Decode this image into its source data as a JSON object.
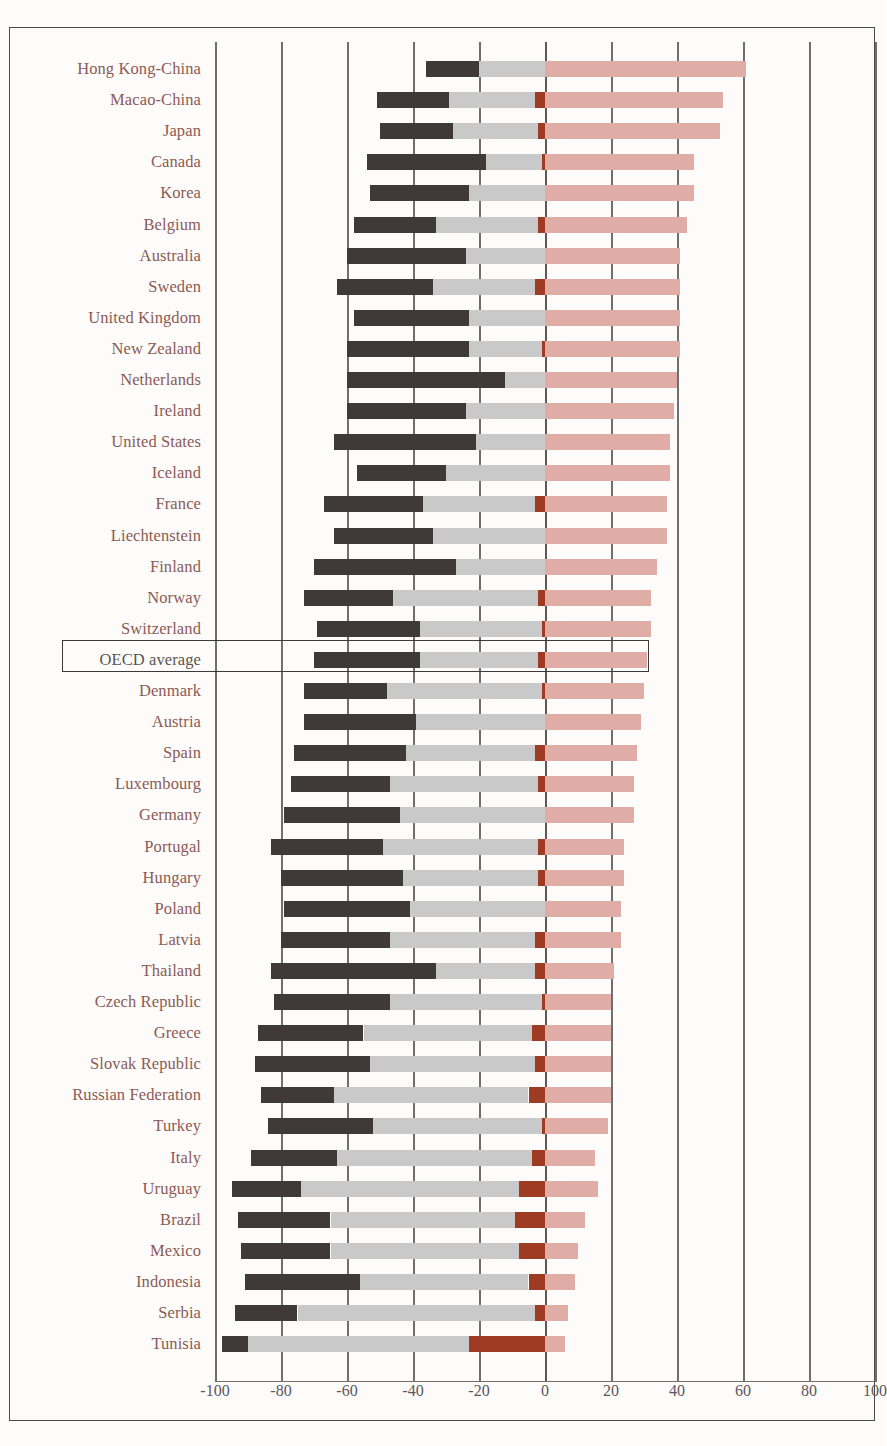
{
  "chart_data": {
    "type": "bar",
    "subtype": "diverging-stacked-horizontal",
    "title": "",
    "xlabel": "",
    "ylabel": "",
    "xlim": [
      -100,
      100
    ],
    "xticks": [
      -100,
      -80,
      -60,
      -40,
      -20,
      0,
      20,
      40,
      60,
      80,
      100
    ],
    "xtick_labels": [
      "-100",
      "-80",
      "-60",
      "-40",
      "-20",
      "0",
      "20",
      "40",
      "60",
      "80",
      "100"
    ],
    "grid": true,
    "legend": "none",
    "series": [
      {
        "name": "negative-outer",
        "color": "#3f3a38"
      },
      {
        "name": "negative-inner",
        "color": "#c9c9c9"
      },
      {
        "name": "positive-inner",
        "color": "#9e3b22"
      },
      {
        "name": "positive-outer",
        "color": "#dfada6"
      }
    ],
    "highlight_category": "OECD average",
    "categories": [
      "Hong Kong-China",
      "Macao-China",
      "Japan",
      "Canada",
      "Korea",
      "Belgium",
      "Australia",
      "Sweden",
      "United Kingdom",
      "New Zealand",
      "Netherlands",
      "Ireland",
      "United States",
      "Iceland",
      "France",
      "Liechtenstein",
      "Finland",
      "Norway",
      "Switzerland",
      "OECD average",
      "Denmark",
      "Austria",
      "Spain",
      "Luxembourg",
      "Germany",
      "Portugal",
      "Hungary",
      "Poland",
      "Latvia",
      "Thailand",
      "Czech Republic",
      "Greece",
      "Slovak Republic",
      "Russian Federation",
      "Turkey",
      "Italy",
      "Uruguay",
      "Brazil",
      "Mexico",
      "Indonesia",
      "Serbia",
      "Tunisia"
    ],
    "rows": [
      {
        "category": "Hong Kong-China",
        "neg_outer_start": -36,
        "neg_outer_end": -20,
        "neg_inner_end": 0,
        "pos_inner_end": 0,
        "pos_outer_end": 61
      },
      {
        "category": "Macao-China",
        "neg_outer_start": -51,
        "neg_outer_end": -29,
        "neg_inner_end": -3,
        "pos_inner_end": 0,
        "pos_outer_end": 54
      },
      {
        "category": "Japan",
        "neg_outer_start": -50,
        "neg_outer_end": -28,
        "neg_inner_end": -2,
        "pos_inner_end": 0,
        "pos_outer_end": 53
      },
      {
        "category": "Canada",
        "neg_outer_start": -54,
        "neg_outer_end": -18,
        "neg_inner_end": -1,
        "pos_inner_end": 0,
        "pos_outer_end": 45
      },
      {
        "category": "Korea",
        "neg_outer_start": -53,
        "neg_outer_end": -23,
        "neg_inner_end": 0,
        "pos_inner_end": 0,
        "pos_outer_end": 45
      },
      {
        "category": "Belgium",
        "neg_outer_start": -58,
        "neg_outer_end": -33,
        "neg_inner_end": -2,
        "pos_inner_end": 0,
        "pos_outer_end": 43
      },
      {
        "category": "Australia",
        "neg_outer_start": -60,
        "neg_outer_end": -24,
        "neg_inner_end": 0,
        "pos_inner_end": 0,
        "pos_outer_end": 41
      },
      {
        "category": "Sweden",
        "neg_outer_start": -63,
        "neg_outer_end": -34,
        "neg_inner_end": -3,
        "pos_inner_end": 0,
        "pos_outer_end": 41
      },
      {
        "category": "United Kingdom",
        "neg_outer_start": -58,
        "neg_outer_end": -23,
        "neg_inner_end": 0,
        "pos_inner_end": 0,
        "pos_outer_end": 41
      },
      {
        "category": "New Zealand",
        "neg_outer_start": -60,
        "neg_outer_end": -23,
        "neg_inner_end": -1,
        "pos_inner_end": 0,
        "pos_outer_end": 41
      },
      {
        "category": "Netherlands",
        "neg_outer_start": -60,
        "neg_outer_end": -12,
        "neg_inner_end": 0,
        "pos_inner_end": 0,
        "pos_outer_end": 40
      },
      {
        "category": "Ireland",
        "neg_outer_start": -60,
        "neg_outer_end": -24,
        "neg_inner_end": 0,
        "pos_inner_end": 0,
        "pos_outer_end": 39
      },
      {
        "category": "United States",
        "neg_outer_start": -64,
        "neg_outer_end": -21,
        "neg_inner_end": 0,
        "pos_inner_end": 0,
        "pos_outer_end": 38
      },
      {
        "category": "Iceland",
        "neg_outer_start": -57,
        "neg_outer_end": -30,
        "neg_inner_end": 0,
        "pos_inner_end": 0,
        "pos_outer_end": 38
      },
      {
        "category": "France",
        "neg_outer_start": -67,
        "neg_outer_end": -37,
        "neg_inner_end": -3,
        "pos_inner_end": 0,
        "pos_outer_end": 37
      },
      {
        "category": "Liechtenstein",
        "neg_outer_start": -64,
        "neg_outer_end": -34,
        "neg_inner_end": 0,
        "pos_inner_end": 0,
        "pos_outer_end": 37
      },
      {
        "category": "Finland",
        "neg_outer_start": -70,
        "neg_outer_end": -27,
        "neg_inner_end": 0,
        "pos_inner_end": 0,
        "pos_outer_end": 34
      },
      {
        "category": "Norway",
        "neg_outer_start": -73,
        "neg_outer_end": -46,
        "neg_inner_end": -2,
        "pos_inner_end": 0,
        "pos_outer_end": 32
      },
      {
        "category": "Switzerland",
        "neg_outer_start": -69,
        "neg_outer_end": -38,
        "neg_inner_end": -1,
        "pos_inner_end": 0,
        "pos_outer_end": 32
      },
      {
        "category": "OECD average",
        "neg_outer_start": -70,
        "neg_outer_end": -38,
        "neg_inner_end": -2,
        "pos_inner_end": 0,
        "pos_outer_end": 31
      },
      {
        "category": "Denmark",
        "neg_outer_start": -73,
        "neg_outer_end": -48,
        "neg_inner_end": -1,
        "pos_inner_end": 0,
        "pos_outer_end": 30
      },
      {
        "category": "Austria",
        "neg_outer_start": -73,
        "neg_outer_end": -39,
        "neg_inner_end": 0,
        "pos_inner_end": 0,
        "pos_outer_end": 29
      },
      {
        "category": "Spain",
        "neg_outer_start": -76,
        "neg_outer_end": -42,
        "neg_inner_end": -3,
        "pos_inner_end": 0,
        "pos_outer_end": 28
      },
      {
        "category": "Luxembourg",
        "neg_outer_start": -77,
        "neg_outer_end": -47,
        "neg_inner_end": -2,
        "pos_inner_end": 0,
        "pos_outer_end": 27
      },
      {
        "category": "Germany",
        "neg_outer_start": -79,
        "neg_outer_end": -44,
        "neg_inner_end": 0,
        "pos_inner_end": 0,
        "pos_outer_end": 27
      },
      {
        "category": "Portugal",
        "neg_outer_start": -83,
        "neg_outer_end": -49,
        "neg_inner_end": -2,
        "pos_inner_end": 0,
        "pos_outer_end": 24
      },
      {
        "category": "Hungary",
        "neg_outer_start": -80,
        "neg_outer_end": -43,
        "neg_inner_end": -2,
        "pos_inner_end": 0,
        "pos_outer_end": 24
      },
      {
        "category": "Poland",
        "neg_outer_start": -79,
        "neg_outer_end": -41,
        "neg_inner_end": 0,
        "pos_inner_end": 0,
        "pos_outer_end": 23
      },
      {
        "category": "Latvia",
        "neg_outer_start": -80,
        "neg_outer_end": -47,
        "neg_inner_end": -3,
        "pos_inner_end": 0,
        "pos_outer_end": 23
      },
      {
        "category": "Thailand",
        "neg_outer_start": -83,
        "neg_outer_end": -33,
        "neg_inner_end": -3,
        "pos_inner_end": 0,
        "pos_outer_end": 21
      },
      {
        "category": "Czech Republic",
        "neg_outer_start": -82,
        "neg_outer_end": -47,
        "neg_inner_end": -1,
        "pos_inner_end": 0,
        "pos_outer_end": 20
      },
      {
        "category": "Greece",
        "neg_outer_start": -87,
        "neg_outer_end": -55,
        "neg_inner_end": -4,
        "pos_inner_end": 0,
        "pos_outer_end": 20
      },
      {
        "category": "Slovak Republic",
        "neg_outer_start": -88,
        "neg_outer_end": -53,
        "neg_inner_end": -3,
        "pos_inner_end": 0,
        "pos_outer_end": 20
      },
      {
        "category": "Russian Federation",
        "neg_outer_start": -86,
        "neg_outer_end": -64,
        "neg_inner_end": -5,
        "pos_inner_end": 0,
        "pos_outer_end": 20
      },
      {
        "category": "Turkey",
        "neg_outer_start": -84,
        "neg_outer_end": -52,
        "neg_inner_end": -1,
        "pos_inner_end": 0,
        "pos_outer_end": 19
      },
      {
        "category": "Italy",
        "neg_outer_start": -89,
        "neg_outer_end": -63,
        "neg_inner_end": -4,
        "pos_inner_end": 0,
        "pos_outer_end": 15
      },
      {
        "category": "Uruguay",
        "neg_outer_start": -95,
        "neg_outer_end": -74,
        "neg_inner_end": -8,
        "pos_inner_end": 0,
        "pos_outer_end": 16
      },
      {
        "category": "Brazil",
        "neg_outer_start": -93,
        "neg_outer_end": -65,
        "neg_inner_end": -9,
        "pos_inner_end": 0,
        "pos_outer_end": 12
      },
      {
        "category": "Mexico",
        "neg_outer_start": -92,
        "neg_outer_end": -65,
        "neg_inner_end": -8,
        "pos_inner_end": 0,
        "pos_outer_end": 10
      },
      {
        "category": "Indonesia",
        "neg_outer_start": -91,
        "neg_outer_end": -56,
        "neg_inner_end": -5,
        "pos_inner_end": 0,
        "pos_outer_end": 9
      },
      {
        "category": "Serbia",
        "neg_outer_start": -94,
        "neg_outer_end": -75,
        "neg_inner_end": -3,
        "pos_inner_end": 0,
        "pos_outer_end": 7
      },
      {
        "category": "Tunisia",
        "neg_outer_start": -98,
        "neg_outer_end": -90,
        "neg_inner_end": -23,
        "pos_inner_end": 0,
        "pos_outer_end": 6
      }
    ]
  },
  "colors": {
    "neg_outer": "#3f3a38",
    "neg_inner": "#c9c9c9",
    "pos_inner": "#9e3b22",
    "pos_outer": "#dfada6",
    "label_text": "#8c5a55",
    "axis_text": "#59565a",
    "gridline": "#6f6f6f",
    "frame": "#4a4a4a",
    "background": "#fdfcfa"
  }
}
